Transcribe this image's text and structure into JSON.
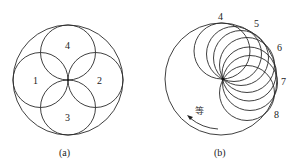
{
  "figure_a": {
    "caption": "(a)",
    "outer_circle": {
      "cx": 68,
      "cy": 80,
      "r": 55
    },
    "regions": [
      {
        "label": "1",
        "cx": 40.5,
        "cy": 80,
        "r": 27.5,
        "lx": 33,
        "ly": 84
      },
      {
        "label": "2",
        "cx": 95.5,
        "cy": 80,
        "r": 27.5,
        "lx": 97,
        "ly": 84
      },
      {
        "label": "3",
        "cx": 68,
        "cy": 107.5,
        "r": 27.5,
        "lx": 65,
        "ly": 121
      },
      {
        "label": "4",
        "cx": 68,
        "cy": 52.5,
        "r": 27.5,
        "lx": 65,
        "ly": 49
      }
    ]
  },
  "figure_b": {
    "caption": "(b)",
    "outer_circle": {
      "cx": 221,
      "cy": 79,
      "r": 56
    },
    "pivot": {
      "x": 223,
      "y": 79
    },
    "positions": [
      {
        "label": "4",
        "lx": 218,
        "ly": 20
      },
      {
        "label": "5",
        "lx": 254,
        "ly": 27
      },
      {
        "label": "6",
        "lx": 277,
        "ly": 51
      },
      {
        "label": "7",
        "lx": 281,
        "ly": 85
      },
      {
        "label": "8",
        "lx": 274,
        "ly": 118
      }
    ],
    "annotation": "等",
    "arrow_direction": "counterclockwise"
  }
}
